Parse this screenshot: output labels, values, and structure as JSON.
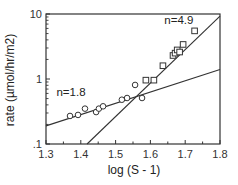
{
  "chart_data": {
    "type": "scatter",
    "title": "",
    "xlabel": "log (S - 1)",
    "ylabel": "rate  (µmol/hr/m2)",
    "xscale": "linear",
    "yscale": "log",
    "xlim": [
      1.3,
      1.8
    ],
    "ylim": [
      0.1,
      10
    ],
    "x_ticks": [
      "1.3",
      "1.4",
      "1.5",
      "1.6",
      "1.7",
      "1.8"
    ],
    "y_ticks": [
      ".1",
      "1",
      "10"
    ],
    "grid": false,
    "legend": null,
    "series": [
      {
        "name": "circles",
        "marker": "circle",
        "points": [
          [
            1.369,
            0.27
          ],
          [
            1.392,
            0.28
          ],
          [
            1.412,
            0.35
          ],
          [
            1.444,
            0.31
          ],
          [
            1.452,
            0.35
          ],
          [
            1.464,
            0.38
          ],
          [
            1.518,
            0.48
          ],
          [
            1.533,
            0.51
          ],
          [
            1.556,
            0.81
          ],
          [
            1.576,
            0.51
          ]
        ]
      },
      {
        "name": "squares",
        "marker": "square",
        "points": [
          [
            1.587,
            0.96
          ],
          [
            1.61,
            0.96
          ],
          [
            1.636,
            1.6
          ],
          [
            1.665,
            2.3
          ],
          [
            1.671,
            2.5
          ],
          [
            1.677,
            2.8
          ],
          [
            1.684,
            2.6
          ],
          [
            1.694,
            3.4
          ],
          [
            1.727,
            5.5
          ]
        ]
      }
    ],
    "fit_lines": [
      {
        "label": "n=1.8",
        "x": [
          1.3,
          1.8
        ],
        "y": [
          0.19,
          1.4
        ]
      },
      {
        "label": "n=4.9",
        "x": [
          1.418,
          1.8
        ],
        "y": [
          0.1,
          9.3
        ]
      }
    ],
    "annotations": [
      {
        "text": "n=1.8",
        "x": 1.33,
        "y": 0.55
      },
      {
        "text": "n=4.9",
        "x": 1.64,
        "y": 7.0
      }
    ]
  }
}
